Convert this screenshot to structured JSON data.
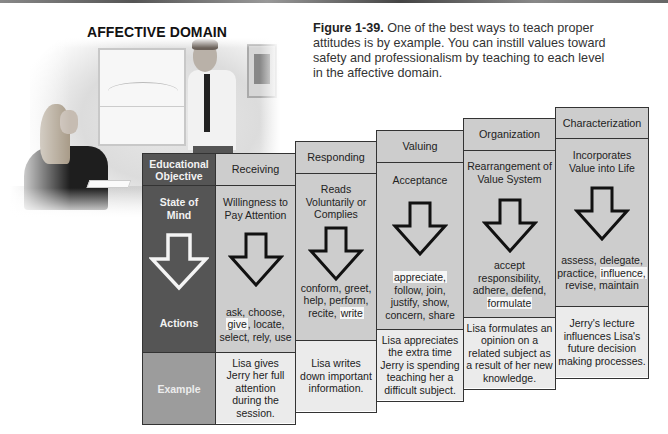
{
  "title": "AFFECTIVE DOMAIN",
  "caption": {
    "label": "Figure 1-39.",
    "text": " One of the best ways to teach proper attitudes is by example. You can instill values toward safety and professionalism by teaching to each level in the affective domain."
  },
  "photo": {
    "description": "Instructor (man in white shirt and tie) standing by a whiteboard talking to a seated woman at a desk"
  },
  "key_column": {
    "header": "Educational Objective",
    "state": "State of Mind",
    "actions": "Actions",
    "example": "Example"
  },
  "levels": [
    {
      "name": "Receiving",
      "state": "Willingness to Pay Attention",
      "actions_parts": [
        "ask, choose,",
        "give",
        ", locate,",
        "select, rely, use"
      ],
      "example": "Lisa gives Jerry her full attention during the session."
    },
    {
      "name": "Responding",
      "state": "Reads Voluntarily or Complies",
      "actions_parts": [
        "conform, greet,",
        "help, perform,",
        "recite, ",
        "write"
      ],
      "example": "Lisa writes down important information."
    },
    {
      "name": "Valuing",
      "state": "Acceptance",
      "actions_parts": [
        "appreciate,",
        "follow, join,",
        "justify, show,",
        "concern, share"
      ],
      "example": "Lisa appreciates the extra time Jerry is spending teaching her a difficult subject."
    },
    {
      "name": "Organization",
      "state": "Rearrangement of Value System",
      "actions_parts": [
        "accept",
        "responsibility,",
        "adhere, defend,",
        "formulate"
      ],
      "example": "Lisa formulates an opinion on a related subject as a result of her new knowledge."
    },
    {
      "name": "Characterization",
      "state": "Incorporates Value into Life",
      "actions_parts": [
        "assess, delegate,",
        "practice, ",
        "influence,",
        "revise, maintain"
      ],
      "example": "Jerry's lecture influences Lisa's future decision making processes."
    }
  ],
  "colors": {
    "key_dark": "#555555",
    "key_example": "#9c9c9c",
    "cell_gray": "#cdcdcd",
    "example_light": "#ebebeb",
    "border": "#333333"
  }
}
